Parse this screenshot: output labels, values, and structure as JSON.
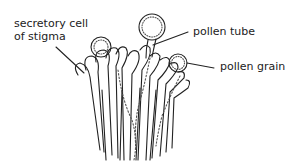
{
  "diagram": {
    "labels": {
      "secretory_cell_line1": "secretory cell",
      "secretory_cell_line2": "of stigma",
      "pollen_tube": "pollen tube",
      "pollen_grain": "pollen grain"
    },
    "colors": {
      "ink": "#222222",
      "background": "#ffffff",
      "stipple": "#555555"
    }
  }
}
